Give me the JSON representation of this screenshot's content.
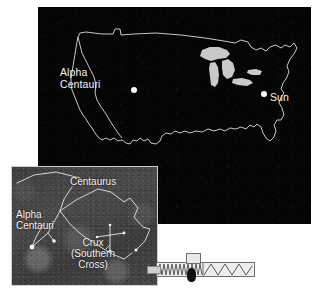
{
  "figure": {
    "name": "alpha-centauri-distance-scale-figure",
    "background_color": "#ffffff"
  },
  "map_panel": {
    "name": "us-map-panel",
    "background_color": "#050505",
    "outline_color": "#c8c8c8",
    "lakes_color": "#c9c9c9",
    "markers": [
      {
        "label": "Alpha\nCentauri",
        "label_line1": "Alpha",
        "label_line2": "Centauri",
        "marker_color": "#ffffff",
        "position": "west-coast"
      },
      {
        "label": "Sun",
        "label_line1": "Sun",
        "marker_color": "#ffffff",
        "position": "east-coast"
      }
    ]
  },
  "inset_panel": {
    "name": "southern-sky-photograph",
    "background_color": "#444444",
    "line_color": "#e6e6e6",
    "labels": [
      {
        "id": "centaurus",
        "text": "Centaurus"
      },
      {
        "id": "alpha-centauri",
        "line1": "Alpha",
        "line2": "Centauri"
      },
      {
        "id": "crux",
        "line1": "Crux",
        "line2": "(Southern",
        "line3": "Cross)"
      }
    ]
  },
  "scale_bar": {
    "name": "scale-bar-graphic",
    "tag_text": "",
    "fill_color": "#e8e8e8",
    "stroke_color": "#6e6e6e"
  }
}
